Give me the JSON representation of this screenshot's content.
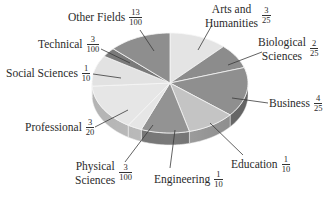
{
  "chart_data": {
    "type": "pie",
    "style": "3d-tilted",
    "title": "",
    "unit": "fraction of total",
    "categories": [
      "Arts and Humanities",
      "Biological Sciences",
      "Business",
      "Education",
      "Engineering",
      "Physical Sciences",
      "Professional",
      "Social Sciences",
      "Technical",
      "Other Fields"
    ],
    "fractions": [
      "3/25",
      "2/25",
      "4/25",
      "1/10",
      "1/10",
      "3/100",
      "3/20",
      "1/10",
      "3/100",
      "13/100"
    ],
    "values": [
      0.12,
      0.08,
      0.16,
      0.1,
      0.1,
      0.03,
      0.15,
      0.1,
      0.03,
      0.13
    ],
    "start_angle": "12 o'clock",
    "direction": "clockwise",
    "legend": "none (leader-line labels)",
    "colors": [
      "#e4e4e4",
      "#8c8c8c",
      "#8f8f8f",
      "#c4c4c4",
      "#939393",
      "#e6e6e6",
      "#e6e6e6",
      "#e2e2e2",
      "#7a7a7a",
      "#8e8e8e"
    ]
  },
  "labels": [
    {
      "name": "Arts and",
      "name2": "Humanities",
      "num": "3",
      "den": "25"
    },
    {
      "name": "Biological",
      "name2": "Sciences",
      "num": "2",
      "den": "25"
    },
    {
      "name": "Business",
      "num": "4",
      "den": "25"
    },
    {
      "name": "Education",
      "num": "1",
      "den": "10"
    },
    {
      "name": "Engineering",
      "num": "1",
      "den": "10"
    },
    {
      "name": "Physical",
      "name2": "Sciences",
      "num": "3",
      "den": "100"
    },
    {
      "name": "Professional",
      "num": "3",
      "den": "20"
    },
    {
      "name": "Social Sciences",
      "num": "1",
      "den": "10"
    },
    {
      "name": "Technical",
      "num": "3",
      "den": "100"
    },
    {
      "name": "Other Fields",
      "num": "13",
      "den": "100"
    }
  ]
}
